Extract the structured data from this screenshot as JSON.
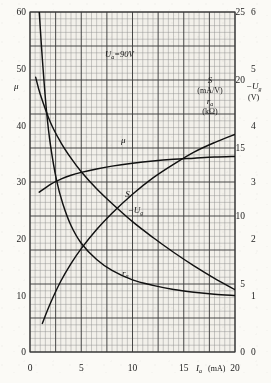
{
  "figure": {
    "annotation": "U",
    "annotation_sub": "a",
    "annotation_value": "=90V",
    "background_color": "#fbfaf6",
    "grid_color": "#4a4a4a",
    "curve_color": "#111111"
  },
  "axes": {
    "left": {
      "label": "μ",
      "ticks": [
        "0",
        "10",
        "20",
        "30",
        "40",
        "50",
        "60"
      ],
      "min": 0,
      "max": 60
    },
    "inner_right": {
      "label_s": "S",
      "unit_s": "(mA/V)",
      "label_r": "r",
      "label_r_sub": "a",
      "unit_r": "(kΩ)",
      "ticks": [
        "0",
        "5",
        "10",
        "15",
        "20",
        "25"
      ],
      "min": 0,
      "max": 25
    },
    "outer_right": {
      "label": "−U",
      "label_sub": "g",
      "unit": "(V)",
      "ticks": [
        "0",
        "1",
        "2",
        "3",
        "4",
        "5",
        "6"
      ],
      "min": 0,
      "max": 6
    },
    "bottom": {
      "label": "I",
      "label_sub": "a",
      "unit": "(mA)",
      "ticks": [
        "0",
        "5",
        "10",
        "15",
        "20"
      ],
      "min": 0,
      "max": 20
    }
  },
  "chart_data": {
    "type": "line",
    "title": "",
    "subtitle": "",
    "xlabel": "I_a (mA)",
    "ylabel": "μ  /  S (mA/V), r_a (kΩ)  /  −U_g (V)",
    "xlim": [
      0,
      20
    ],
    "ylim": [
      0,
      60
    ],
    "grid": true,
    "legend": "inline-curve-labels",
    "annotations": [
      {
        "text": "U_a = 90 V",
        "x": 6.5,
        "y": 51.5
      }
    ],
    "series": [
      {
        "name": "μ",
        "axis": "left",
        "label": "μ",
        "label_x": 9.1,
        "label_y": 36.8,
        "x": [
          0.9,
          2.0,
          3.0,
          4.0,
          5.0,
          6.5,
          8.0,
          10.0,
          12.0,
          14.0,
          16.0,
          18.0,
          20.0
        ],
        "values": [
          28.2,
          29.6,
          30.5,
          31.2,
          31.7,
          32.3,
          32.8,
          33.3,
          33.7,
          34.0,
          34.2,
          34.4,
          34.5
        ]
      },
      {
        "name": "S",
        "axis": "inner_right",
        "label": "S",
        "label_x": 9.5,
        "label_y_axis_value": 11.4,
        "x": [
          1.2,
          2.0,
          3.0,
          4.0,
          5.0,
          6.5,
          8.0,
          10.0,
          12.0,
          14.0,
          16.0,
          18.0,
          20.0
        ],
        "values": [
          2.1,
          3.6,
          5.2,
          6.5,
          7.6,
          9.0,
          10.2,
          11.6,
          12.8,
          13.8,
          14.7,
          15.4,
          16.0
        ]
      },
      {
        "name": "−U_g",
        "axis": "outer_right",
        "label": "−U",
        "label_sub": "g",
        "label_x": 10.3,
        "label_y_axis_value": 2.45,
        "x": [
          0.55,
          1.0,
          2.0,
          3.0,
          4.0,
          5.0,
          6.5,
          8.0,
          10.0,
          12.0,
          14.0,
          16.0,
          18.0,
          20.0
        ],
        "values": [
          4.85,
          4.55,
          4.05,
          3.7,
          3.42,
          3.18,
          2.88,
          2.62,
          2.3,
          2.02,
          1.76,
          1.52,
          1.3,
          1.1
        ]
      },
      {
        "name": "r_a",
        "axis": "inner_right",
        "label": "r",
        "label_sub": "a",
        "label_x": 9.3,
        "label_y_axis_value": 5.6,
        "x": [
          0.9,
          1.2,
          1.6,
          2.0,
          2.6,
          3.2,
          4.0,
          5.0,
          6.5,
          8.0,
          10.0,
          12.0,
          14.0,
          16.0,
          18.0,
          20.0
        ],
        "values": [
          25.0,
          21.6,
          17.8,
          15.2,
          12.6,
          10.9,
          9.3,
          8.0,
          6.8,
          6.0,
          5.3,
          4.9,
          4.6,
          4.4,
          4.25,
          4.15
        ]
      }
    ]
  }
}
